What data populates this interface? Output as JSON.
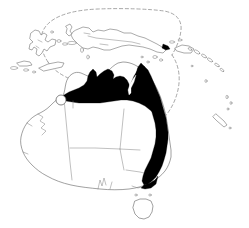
{
  "figure": {
    "type": "distribution-map",
    "region": "Australia and New Guinea",
    "width": 249,
    "height": 228,
    "background_color": "#ffffff",
    "caption": ""
  },
  "legend": {
    "range_fill_label": "shaded distribution range",
    "range_fill_color": "#000000",
    "coastline_color": "#666666",
    "internal_border_color": "#818181",
    "boundary_line_label": "dashed biogeographic boundary",
    "boundary_line_color": "#8a8a8a",
    "record_marker_label": "isolated record",
    "record_marker_color": "#5e5e5e"
  },
  "landmasses": [
    {
      "name": "Australia",
      "shaded": true
    },
    {
      "name": "New Guinea",
      "shaded": true
    },
    {
      "name": "Tasmania",
      "shaded": false
    },
    {
      "name": "Sulawesi",
      "shaded": false
    },
    {
      "name": "Moluccas",
      "shaded": false
    },
    {
      "name": "Lesser Sunda Islands",
      "shaded": false
    },
    {
      "name": "New Britain",
      "shaded": false
    },
    {
      "name": "Solomon Islands",
      "shaded": false
    },
    {
      "name": "Vanuatu",
      "shaded": false
    },
    {
      "name": "New Caledonia",
      "shaded": false
    }
  ],
  "shaded_regions": [
    {
      "name": "Kimberley coast",
      "shaded": true
    },
    {
      "name": "Top End / Arnhem Land",
      "shaded": true
    },
    {
      "name": "Gulf of Carpentaria coast",
      "shaded": true
    },
    {
      "name": "Cape York Peninsula",
      "shaded": true
    },
    {
      "name": "Queensland east coast",
      "shaded": true
    },
    {
      "name": "New South Wales east coast",
      "shaded": true
    },
    {
      "name": "Victoria / Gippsland",
      "shaded": true
    },
    {
      "name": "Papuan Peninsula",
      "shaded": true
    }
  ],
  "unshaded_regions": [
    {
      "name": "Western Australia interior",
      "shaded": false
    },
    {
      "name": "South Australia",
      "shaded": false
    },
    {
      "name": "Central desert",
      "shaded": false
    },
    {
      "name": "Tasmania",
      "shaded": false
    }
  ],
  "markers": [
    {
      "name": "kimberley-record",
      "type": "open-circle",
      "x": 61,
      "y": 100
    }
  ]
}
